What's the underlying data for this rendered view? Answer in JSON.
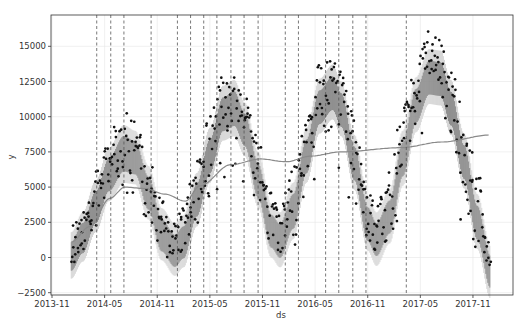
{
  "chart_data": {
    "type": "line",
    "title": "",
    "xlabel": "ds",
    "ylabel": "y",
    "ylim": [
      -2750,
      17200
    ],
    "xlim_months_from_2013_11": [
      -0.1,
      52.7
    ],
    "grid": true,
    "legend": null,
    "x_ticks": [
      "2013-11",
      "2014-05",
      "2014-11",
      "2015-05",
      "2015-11",
      "2016-05",
      "2016-11",
      "2017-05",
      "2017-11"
    ],
    "x_tick_months": [
      0,
      6,
      12,
      18,
      24,
      30,
      36,
      42,
      48
    ],
    "y_ticks": [
      -2500,
      0,
      2500,
      5000,
      7500,
      10000,
      12500,
      15000
    ],
    "y_tick_labels": [
      "−2500",
      "0",
      "2500",
      "5000",
      "7500",
      "10000",
      "12500",
      "15000"
    ],
    "changepoints_months": [
      5.1,
      6.7,
      8.2,
      11.3,
      14.3,
      15.8,
      17.3,
      18.8,
      20.4,
      21.9,
      23.5,
      26.6,
      28.1,
      31.2,
      32.7,
      34.3,
      35.8,
      40.4
    ],
    "trend": {
      "x": [
        2.2,
        4.3,
        6.6,
        8.3,
        10.6,
        12.9,
        15.2,
        16.9,
        20.4,
        23.8,
        26.7,
        29.5,
        32.9,
        39.8,
        44.4,
        50.0
      ],
      "y": [
        1100,
        2200,
        4200,
        5000,
        4900,
        4500,
        4000,
        5100,
        6600,
        7000,
        6800,
        7200,
        7500,
        7800,
        8200,
        8700
      ]
    },
    "yhat": {
      "x": [
        2.2,
        3.5,
        5,
        6.5,
        8.2,
        9.5,
        11,
        12.5,
        14,
        15,
        16.5,
        18,
        19.5,
        20.8,
        22,
        23.5,
        25,
        26,
        27.5,
        29,
        30.5,
        32,
        33,
        34.5,
        36,
        37,
        38.5,
        40,
        41.5,
        43,
        44.3,
        45.5,
        47,
        48.5,
        50
      ],
      "upper": [
        1800,
        3200,
        5500,
        7800,
        9400,
        9000,
        6500,
        3500,
        2400,
        3000,
        6000,
        9200,
        12200,
        12600,
        11000,
        7500,
        3800,
        3200,
        5300,
        9200,
        12700,
        13700,
        12500,
        8700,
        4400,
        3200,
        4800,
        9000,
        12800,
        14800,
        14700,
        12600,
        8800,
        4500,
        800
      ],
      "lower": [
        -1500,
        -300,
        1800,
        4000,
        5300,
        5200,
        2700,
        -200,
        -1300,
        -700,
        2200,
        5300,
        8300,
        8600,
        7200,
        3600,
        0,
        -700,
        1300,
        5300,
        8800,
        9800,
        8600,
        4800,
        500,
        -600,
        1000,
        5100,
        8900,
        10900,
        10800,
        8700,
        4900,
        600,
        -2900
      ],
      "mid": [
        100,
        1400,
        3600,
        5900,
        7400,
        7100,
        4600,
        1600,
        500,
        1100,
        4100,
        7200,
        10200,
        10600,
        9100,
        5500,
        1900,
        1200,
        3300,
        7200,
        10700,
        11700,
        10500,
        6700,
        2400,
        1300,
        2900,
        7000,
        10800,
        12800,
        12700,
        10600,
        6800,
        2500,
        -1000
      ]
    },
    "observed_bands": {
      "x": [
        2.2,
        3.5,
        5,
        6.5,
        8.2,
        9.5,
        11,
        12.5,
        14,
        15,
        16.5,
        18,
        19.5,
        20.8,
        22,
        23.5,
        25,
        26,
        27.5,
        29,
        30.5,
        32,
        33,
        34.5,
        36,
        37,
        38.5,
        40,
        41.5,
        43,
        44.3,
        45.5,
        47,
        48.5,
        50
      ],
      "top": [
        2400,
        3600,
        6200,
        8800,
        10400,
        9900,
        7600,
        4200,
        3000,
        3800,
        7000,
        10200,
        13000,
        12900,
        11800,
        8800,
        4800,
        4000,
        6400,
        10200,
        13800,
        14200,
        13400,
        9900,
        5200,
        3900,
        6400,
        10500,
        13800,
        16100,
        15600,
        13700,
        10400,
        6200,
        1000
      ],
      "bottom": [
        0,
        500,
        1300,
        2500,
        3800,
        4000,
        1800,
        500,
        200,
        500,
        1300,
        3500,
        5200,
        5300,
        4600,
        2200,
        300,
        200,
        700,
        3000,
        5800,
        6200,
        5800,
        3000,
        300,
        200,
        600,
        2800,
        6000,
        7800,
        7600,
        5200,
        2000,
        500,
        300
      ]
    },
    "styles": {
      "point_color": "#111111",
      "band_color": "#6e6e6e",
      "interval_color": "#d0d0d0",
      "trend_color": "#8a8a8a",
      "changepoint_color": "#555555",
      "grid_color": "#e6e6e6",
      "frame_color": "#333333"
    }
  }
}
